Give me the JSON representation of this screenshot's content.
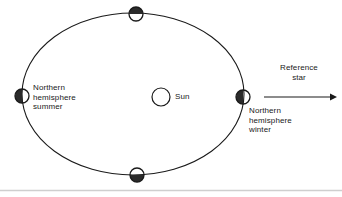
{
  "diagram": {
    "sun": {
      "label": "Sun",
      "fill": "#ffffff",
      "stroke": "#1a1a1a"
    },
    "orbit": {
      "stroke": "#1a1a1a",
      "fill": "none",
      "shape": "ellipse"
    },
    "labels": {
      "northern_hemisphere_summer": "Northern\nhemisphere\nsummer",
      "northern_hemisphere_winter": "Northern\nhemisphere\nwinter",
      "reference_star": "Reference\nstar"
    },
    "earth_positions": [
      {
        "name": "left",
        "season_label": "Northern hemisphere summer",
        "shaded_half": "left",
        "shade_color": "#2b2b2b",
        "lit_color": "#ffffff"
      },
      {
        "name": "top",
        "season_label": "",
        "shaded_half": "top",
        "shade_color": "#2b2b2b",
        "lit_color": "#ffffff"
      },
      {
        "name": "right",
        "season_label": "Northern hemisphere winter",
        "shaded_half": "left",
        "shade_color": "#2b2b2b",
        "lit_color": "#ffffff"
      },
      {
        "name": "bottom",
        "season_label": "",
        "shaded_half": "bottom",
        "shade_color": "#2b2b2b",
        "lit_color": "#ffffff"
      }
    ],
    "arrow": {
      "direction": "right",
      "color": "#1a1a1a"
    },
    "divider": {
      "color": "#cfcfcf"
    }
  }
}
